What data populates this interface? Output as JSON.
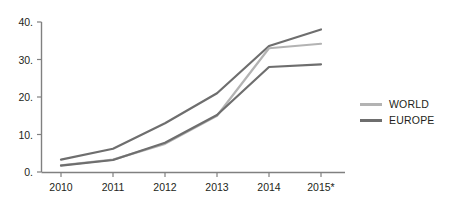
{
  "chart_data": {
    "type": "line",
    "title": "",
    "subtitle": "",
    "xlabel": "",
    "ylabel": "",
    "x": [
      "2010",
      "2011",
      "2012",
      "2013",
      "2014",
      "2015*"
    ],
    "categories": [
      "2010",
      "2011",
      "2012",
      "2013",
      "2014",
      "2015*"
    ],
    "series": [
      {
        "name": "",
        "color": "#6e6e6e",
        "values": [
          3.3,
          6.2,
          13.0,
          21.0,
          33.6,
          38.0
        ]
      },
      {
        "name": "WORLD",
        "color": "#b3b3b3",
        "values": [
          1.8,
          3.3,
          7.5,
          15.0,
          33.0,
          34.2
        ]
      },
      {
        "name": "EUROPE",
        "color": "#6e6e6e",
        "values": [
          1.7,
          3.2,
          7.8,
          15.2,
          28.0,
          28.7
        ]
      }
    ],
    "xlim": [
      "2010",
      "2015*"
    ],
    "ylim": [
      0,
      40
    ],
    "y_ticks": [
      0,
      10,
      20,
      30,
      40
    ],
    "y_tick_labels": [
      "0.",
      "10.",
      "20.",
      "30.",
      "40."
    ],
    "x_tick_labels": [
      "2010",
      "2011",
      "2012",
      "2013",
      "2014",
      "2015*"
    ],
    "grid": false,
    "legend_position": "right",
    "legend": [
      {
        "label": "WORLD",
        "color": "#b3b3b3"
      },
      {
        "label": "EUROPE",
        "color": "#6e6e6e"
      }
    ],
    "axis_color": "#808080",
    "background_color": "#ffffff"
  },
  "legend": {
    "items": [
      {
        "label": "WORLD"
      },
      {
        "label": "EUROPE"
      }
    ]
  },
  "axes": {
    "y_labels": [
      "40.",
      "30.",
      "20.",
      "10.",
      "0."
    ],
    "x_labels": [
      "2010",
      "2011",
      "2012",
      "2013",
      "2014",
      "2015*"
    ]
  }
}
